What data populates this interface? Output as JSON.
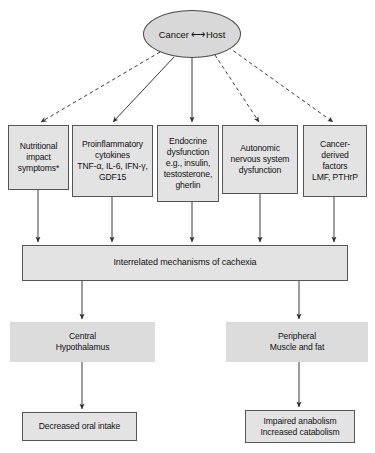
{
  "diagram": {
    "root": {
      "label_left": "Cancer",
      "label_arrow": "⟷",
      "label_right": "Host"
    },
    "mediators": [
      {
        "id": "nutritional-impact-symptoms",
        "lines": [
          "Nutritional",
          "impact",
          "symptoms*"
        ]
      },
      {
        "id": "proinflammatory-cytokines",
        "lines": [
          "Proinflammatory",
          "cytokines",
          "TNF-α, IL-6, IFN-γ,",
          "GDF15"
        ]
      },
      {
        "id": "endocrine-dysfunction",
        "lines": [
          "Endocrine",
          "dysfunction",
          "e.g., insulin,",
          "testosterone,",
          "gherlin"
        ]
      },
      {
        "id": "autonomic-nervous-system-dysfunction",
        "lines": [
          "Autonomic",
          "nervous system",
          "dysfunction"
        ]
      },
      {
        "id": "cancer-derived-factors",
        "lines": [
          "Cancer-",
          "derived",
          "factors",
          "LMF, PTHrP"
        ]
      }
    ],
    "mechanisms_bar": {
      "label": "Interrelated mechanisms of cachexia"
    },
    "effect_nodes": [
      {
        "id": "central-hypothalamus",
        "lines": [
          "Central",
          "Hypothalamus"
        ]
      },
      {
        "id": "peripheral-muscle-and-fat",
        "lines": [
          "Peripheral",
          "Muscle and fat"
        ]
      }
    ],
    "outcome_nodes": [
      {
        "id": "decreased-oral-intake",
        "lines": [
          "Decreased oral intake"
        ]
      },
      {
        "id": "impaired-anabolism-increased-catabolism",
        "lines": [
          "Impaired anabolism",
          "Increased catabolism"
        ]
      }
    ],
    "colors": {
      "node_fill": "#e3e3e3",
      "plain_fill": "#dcdcdc",
      "ellipse_fill": "#d8d8d8",
      "stroke": "#555555",
      "edge": "#3a3a3a",
      "background": "#ffffff"
    },
    "edges": [
      {
        "id": "root-to-nutritional-impact-symptoms",
        "style": "dashed"
      },
      {
        "id": "root-to-proinflammatory-cytokines",
        "style": "solid"
      },
      {
        "id": "root-to-endocrine-dysfunction",
        "style": "solid"
      },
      {
        "id": "root-to-autonomic-nervous-system-dysfunction",
        "style": "dashed"
      },
      {
        "id": "root-to-cancer-derived-factors",
        "style": "dashed"
      },
      {
        "id": "nutritional-impact-symptoms-to-mechanisms",
        "style": "solid"
      },
      {
        "id": "proinflammatory-cytokines-to-mechanisms",
        "style": "solid"
      },
      {
        "id": "endocrine-dysfunction-to-mechanisms",
        "style": "solid"
      },
      {
        "id": "autonomic-nervous-system-dysfunction-to-mechanisms",
        "style": "solid"
      },
      {
        "id": "cancer-derived-factors-to-mechanisms",
        "style": "solid"
      },
      {
        "id": "mechanisms-to-central-hypothalamus",
        "style": "solid"
      },
      {
        "id": "mechanisms-to-peripheral-muscle-and-fat",
        "style": "solid"
      },
      {
        "id": "central-hypothalamus-to-decreased-oral-intake",
        "style": "solid"
      },
      {
        "id": "peripheral-muscle-and-fat-to-impaired-anabolism",
        "style": "solid"
      }
    ]
  }
}
